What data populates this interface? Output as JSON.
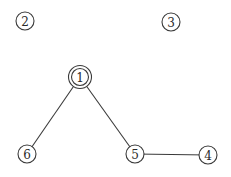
{
  "diagram": {
    "type": "graph",
    "nodes": [
      {
        "id": "1",
        "label": "1",
        "x": 80,
        "y": 77,
        "double": true
      },
      {
        "id": "2",
        "label": "2",
        "x": 25,
        "y": 21,
        "double": false
      },
      {
        "id": "3",
        "label": "3",
        "x": 171,
        "y": 22,
        "double": false
      },
      {
        "id": "4",
        "label": "4",
        "x": 208,
        "y": 155,
        "double": false
      },
      {
        "id": "5",
        "label": "5",
        "x": 135,
        "y": 154,
        "double": false
      },
      {
        "id": "6",
        "label": "6",
        "x": 27,
        "y": 154,
        "double": false
      }
    ],
    "edges": [
      {
        "from": "1",
        "to": "6"
      },
      {
        "from": "1",
        "to": "5"
      },
      {
        "from": "5",
        "to": "4"
      }
    ]
  }
}
